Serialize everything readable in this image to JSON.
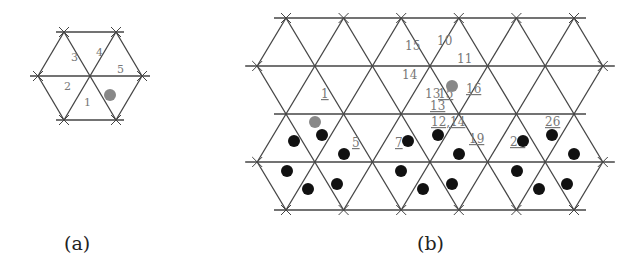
{
  "figure": {
    "colors": {
      "line": "#444444",
      "label": "#777777",
      "dot_black": "#111111",
      "dot_gray": "#888888"
    },
    "panel_a": {
      "caption": "(a)",
      "center": [
        90,
        76
      ],
      "spacing": 52,
      "row_height": 44,
      "triangle_labels": [
        {
          "text": "1",
          "x": 84,
          "y": 106,
          "underline": false
        },
        {
          "text": "2",
          "x": 64,
          "y": 90,
          "underline": false
        },
        {
          "text": "3",
          "x": 71,
          "y": 61,
          "underline": false
        },
        {
          "text": "4",
          "x": 96,
          "y": 56,
          "underline": false
        },
        {
          "text": "5",
          "x": 117,
          "y": 73,
          "underline": false
        }
      ],
      "dots": [
        {
          "x": 110,
          "y": 95,
          "color": "gray"
        }
      ]
    },
    "panel_b": {
      "caption": "(b)",
      "rows_y": [
        18,
        66,
        114,
        162,
        210
      ],
      "spacing": 57.6,
      "row_height": 48,
      "triangle_labels": [
        {
          "text": "15",
          "x": 405,
          "y": 50,
          "underline": false
        },
        {
          "text": "10",
          "x": 437,
          "y": 45,
          "underline": false
        },
        {
          "text": "11",
          "x": 457,
          "y": 63,
          "underline": false
        },
        {
          "text": "14",
          "x": 402,
          "y": 79,
          "underline": false
        },
        {
          "text": "1",
          "x": 321,
          "y": 98,
          "underline": true
        },
        {
          "text": "13",
          "x": 425,
          "y": 98,
          "underline": false
        },
        {
          "text": "15",
          "x": 438,
          "y": 98,
          "underline": true
        },
        {
          "text": "16",
          "x": 466,
          "y": 93,
          "underline": true
        },
        {
          "text": "13",
          "x": 430,
          "y": 110,
          "underline": true
        },
        {
          "text": "12,14",
          "x": 431,
          "y": 126,
          "underline": true
        },
        {
          "text": "5",
          "x": 352,
          "y": 147,
          "underline": true
        },
        {
          "text": "7",
          "x": 395,
          "y": 147,
          "underline": true
        },
        {
          "text": "19",
          "x": 469,
          "y": 143,
          "underline": true
        },
        {
          "text": "21",
          "x": 510,
          "y": 146,
          "underline": true
        },
        {
          "text": "26",
          "x": 545,
          "y": 126,
          "underline": true
        }
      ],
      "dots": [
        {
          "x": 452,
          "y": 86,
          "color": "gray"
        },
        {
          "x": 315,
          "y": 122,
          "color": "gray"
        },
        {
          "x": 294,
          "y": 141,
          "color": "black"
        },
        {
          "x": 322,
          "y": 135,
          "color": "black"
        },
        {
          "x": 344,
          "y": 154,
          "color": "black"
        },
        {
          "x": 287,
          "y": 171,
          "color": "black"
        },
        {
          "x": 308,
          "y": 189,
          "color": "black"
        },
        {
          "x": 337,
          "y": 184,
          "color": "black"
        },
        {
          "x": 408,
          "y": 141,
          "color": "black"
        },
        {
          "x": 438,
          "y": 135,
          "color": "black"
        },
        {
          "x": 459,
          "y": 154,
          "color": "black"
        },
        {
          "x": 401,
          "y": 171,
          "color": "black"
        },
        {
          "x": 423,
          "y": 189,
          "color": "black"
        },
        {
          "x": 452,
          "y": 184,
          "color": "black"
        },
        {
          "x": 523,
          "y": 141,
          "color": "black"
        },
        {
          "x": 552,
          "y": 135,
          "color": "black"
        },
        {
          "x": 574,
          "y": 154,
          "color": "black"
        },
        {
          "x": 517,
          "y": 171,
          "color": "black"
        },
        {
          "x": 539,
          "y": 189,
          "color": "black"
        },
        {
          "x": 567,
          "y": 184,
          "color": "black"
        }
      ]
    }
  }
}
